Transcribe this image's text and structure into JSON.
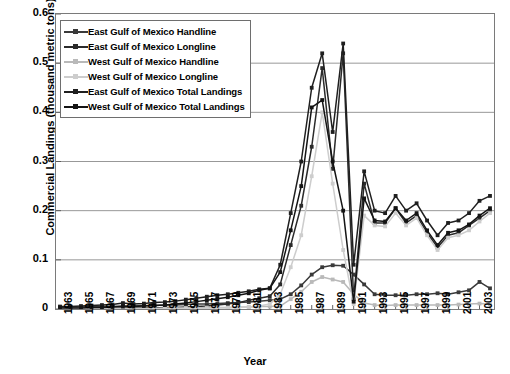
{
  "chart_data": {
    "type": "line",
    "title": "",
    "xlabel": "Year",
    "ylabel": "Commercial Landings (thousand metric tons)",
    "ylim": [
      0,
      0.6
    ],
    "yticks": [
      0.6,
      0.5,
      0.4,
      0.3,
      0.2,
      0.1,
      0
    ],
    "ytick_labels": [
      "0.6",
      "0.5",
      "0.4",
      "0.3",
      "0.2",
      "0.1",
      "0"
    ],
    "grid": "horizontal",
    "legend_position": "upper-left",
    "x": [
      1963,
      1964,
      1965,
      1966,
      1967,
      1968,
      1969,
      1970,
      1971,
      1972,
      1973,
      1974,
      1975,
      1976,
      1977,
      1978,
      1979,
      1980,
      1981,
      1982,
      1983,
      1984,
      1985,
      1986,
      1987,
      1988,
      1989,
      1990,
      1991,
      1992,
      1993,
      1994,
      1995,
      1996,
      1997,
      1998,
      1999,
      2000,
      2001,
      2002,
      2003,
      2004
    ],
    "xtick_labels": [
      "1963",
      "1965",
      "1967",
      "1969",
      "1971",
      "1973",
      "1975",
      "1977",
      "1979",
      "1981",
      "1983",
      "1985",
      "1987",
      "1989",
      "1991",
      "1993",
      "1995",
      "1997",
      "1999",
      "2001",
      "2003"
    ],
    "series": [
      {
        "name": "East Gulf of Mexico Handline",
        "color": "#3a3a3a",
        "marker": "square",
        "values": [
          0.004,
          0.004,
          0.004,
          0.005,
          0.005,
          0.005,
          0.006,
          0.006,
          0.007,
          0.007,
          0.008,
          0.008,
          0.009,
          0.01,
          0.01,
          0.011,
          0.012,
          0.013,
          0.014,
          0.016,
          0.018,
          0.02,
          0.03,
          0.048,
          0.07,
          0.085,
          0.089,
          0.088,
          0.07,
          0.05,
          0.03,
          0.028,
          0.028,
          0.028,
          0.03,
          0.03,
          0.032,
          0.03,
          0.034,
          0.038,
          0.055,
          0.042
        ]
      },
      {
        "name": "East Gulf of Mexico Longline",
        "color": "#2b2b2b",
        "marker": "square",
        "values": [
          0.001,
          0.001,
          0.001,
          0.001,
          0.001,
          0.001,
          0.002,
          0.002,
          0.002,
          0.002,
          0.003,
          0.003,
          0.004,
          0.005,
          0.006,
          0.008,
          0.01,
          0.013,
          0.018,
          0.022,
          0.026,
          0.05,
          0.13,
          0.21,
          0.33,
          0.49,
          0.285,
          0.52,
          0.02,
          0.255,
          0.175,
          0.175,
          0.205,
          0.175,
          0.19,
          0.155,
          0.125,
          0.15,
          0.155,
          0.17,
          0.185,
          0.2
        ]
      },
      {
        "name": "West Gulf of Mexico Handline",
        "color": "#b9b9b9",
        "marker": "square",
        "values": [
          0.001,
          0.001,
          0.001,
          0.001,
          0.001,
          0.001,
          0.001,
          0.001,
          0.001,
          0.001,
          0.002,
          0.002,
          0.002,
          0.002,
          0.003,
          0.003,
          0.003,
          0.004,
          0.004,
          0.005,
          0.005,
          0.006,
          0.02,
          0.035,
          0.055,
          0.065,
          0.06,
          0.055,
          0.03,
          0.012,
          0.008,
          0.007,
          0.008,
          0.008,
          0.008,
          0.008,
          0.008,
          0.008,
          0.009,
          0.01,
          0.011,
          0.01
        ]
      },
      {
        "name": "West Gulf of Mexico Longline",
        "color": "#cdcdcd",
        "marker": "square",
        "values": [
          0.0,
          0.0,
          0.0,
          0.0,
          0.0,
          0.0,
          0.0,
          0.0,
          0.0,
          0.0,
          0.0,
          0.001,
          0.001,
          0.001,
          0.001,
          0.002,
          0.002,
          0.003,
          0.004,
          0.006,
          0.01,
          0.03,
          0.085,
          0.15,
          0.27,
          0.4,
          0.255,
          0.12,
          0.01,
          0.19,
          0.17,
          0.168,
          0.195,
          0.17,
          0.185,
          0.15,
          0.12,
          0.145,
          0.15,
          0.16,
          0.178,
          0.195
        ]
      },
      {
        "name": "East Gulf of Mexico Total Landings",
        "color": "#1f1f1f",
        "marker": "square",
        "values": [
          0.005,
          0.005,
          0.006,
          0.007,
          0.008,
          0.009,
          0.012,
          0.01,
          0.011,
          0.013,
          0.014,
          0.016,
          0.019,
          0.022,
          0.025,
          0.028,
          0.03,
          0.033,
          0.036,
          0.04,
          0.042,
          0.09,
          0.195,
          0.3,
          0.45,
          0.52,
          0.36,
          0.54,
          0.09,
          0.28,
          0.2,
          0.195,
          0.23,
          0.2,
          0.215,
          0.18,
          0.15,
          0.175,
          0.18,
          0.195,
          0.22,
          0.23
        ]
      },
      {
        "name": "West Gulf of Mexico Total Landings",
        "color": "#141414",
        "marker": "square",
        "values": [
          0.002,
          0.002,
          0.002,
          0.003,
          0.003,
          0.004,
          0.005,
          0.005,
          0.006,
          0.007,
          0.008,
          0.01,
          0.012,
          0.015,
          0.018,
          0.021,
          0.024,
          0.028,
          0.032,
          0.038,
          0.042,
          0.075,
          0.16,
          0.25,
          0.41,
          0.425,
          0.3,
          0.2,
          0.015,
          0.225,
          0.18,
          0.178,
          0.205,
          0.18,
          0.195,
          0.16,
          0.13,
          0.155,
          0.16,
          0.172,
          0.19,
          0.205
        ]
      }
    ]
  },
  "legend": {
    "items": [
      {
        "label": "East Gulf of Mexico Handline",
        "color": "#3a3a3a"
      },
      {
        "label": "East Gulf of Mexico Longline",
        "color": "#2b2b2b"
      },
      {
        "label": "West Gulf of Mexico Handline",
        "color": "#b9b9b9"
      },
      {
        "label": "West Gulf of Mexico Longline",
        "color": "#cdcdcd"
      },
      {
        "label": "East Gulf of Mexico Total Landings",
        "color": "#1f1f1f"
      },
      {
        "label": "West Gulf of Mexico Total Landings",
        "color": "#141414"
      }
    ]
  }
}
